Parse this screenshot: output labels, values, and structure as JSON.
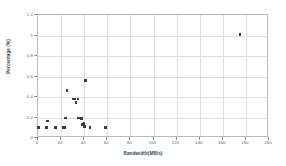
{
  "chart_data": {
    "type": "scatter",
    "title": "",
    "xlabel": "Bandwidth(MB/s)",
    "ylabel": "Percentage (%)",
    "xlim": [
      0,
      200
    ],
    "ylim": [
      0,
      1.2
    ],
    "xticks": [
      0,
      20,
      40,
      60,
      80,
      100,
      120,
      140,
      160,
      180,
      200
    ],
    "xtick_labels": [
      "0",
      "20",
      "40",
      "60",
      "80",
      "100",
      "120",
      "140",
      "160",
      "180",
      "200"
    ],
    "yticks": [
      0,
      0.2,
      0.4,
      0.6,
      0.8,
      1,
      1.2
    ],
    "ytick_labels": [
      "0",
      "0.2",
      "0.4",
      "0.6",
      "0.8",
      "1",
      "1.2"
    ],
    "grid": true,
    "grid_color": "#dedede",
    "marker": "square",
    "marker_color": "#3b3b3b",
    "marker_size": 2.6,
    "legend": false,
    "points": [
      {
        "x": 0.5,
        "y": 0.105
      },
      {
        "x": 7.5,
        "y": 0.105
      },
      {
        "x": 8.0,
        "y": 0.165
      },
      {
        "x": 15.0,
        "y": 0.105
      },
      {
        "x": 21.5,
        "y": 0.105
      },
      {
        "x": 23.5,
        "y": 0.105
      },
      {
        "x": 24.0,
        "y": 0.195
      },
      {
        "x": 25.0,
        "y": 0.465
      },
      {
        "x": 30.5,
        "y": 0.38
      },
      {
        "x": 32.0,
        "y": 0.38
      },
      {
        "x": 33.0,
        "y": 0.345
      },
      {
        "x": 34.5,
        "y": 0.38
      },
      {
        "x": 35.0,
        "y": 0.195
      },
      {
        "x": 37.5,
        "y": 0.19
      },
      {
        "x": 38.5,
        "y": 0.13
      },
      {
        "x": 39.5,
        "y": 0.125
      },
      {
        "x": 40.0,
        "y": 0.145
      },
      {
        "x": 40.5,
        "y": 0.11
      },
      {
        "x": 41.0,
        "y": 0.56
      },
      {
        "x": 45.0,
        "y": 0.105
      },
      {
        "x": 58.5,
        "y": 0.105
      },
      {
        "x": 175.0,
        "y": 1.01
      }
    ]
  }
}
